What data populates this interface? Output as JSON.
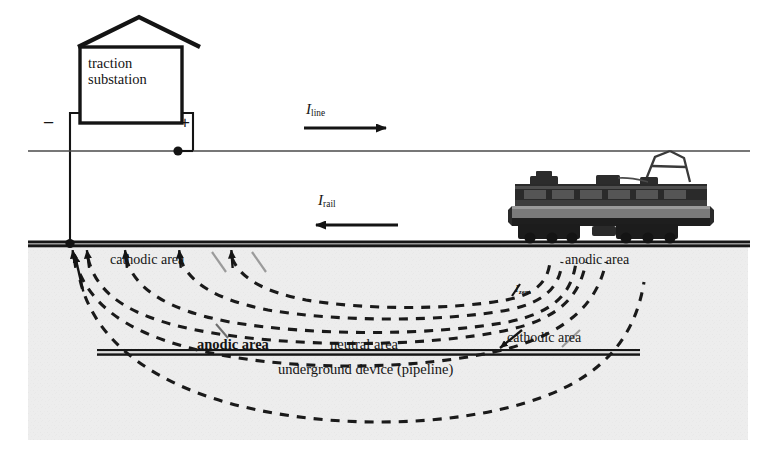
{
  "diagram": {
    "soil": {
      "fill": "#ededed",
      "left": 28,
      "top": 246,
      "width": 720,
      "height": 194
    },
    "substation": {
      "label_line1": "traction",
      "label_line2": "substation",
      "terminal_negative": "−",
      "terminal_positive": "+"
    },
    "currents": [
      {
        "name": "line-current",
        "symbol": "I",
        "subscript": "line",
        "direction": "right"
      },
      {
        "name": "rail-current",
        "symbol": "I",
        "subscript": "rail",
        "direction": "left"
      },
      {
        "name": "earth-current",
        "symbol": "I",
        "subscript": "zem",
        "direction": "none"
      }
    ],
    "rail_labels": {
      "cathodic": "cathodic area",
      "anodic": "anodic area"
    },
    "pipeline_labels": {
      "anodic": "anodic area",
      "neutral": "neutral area",
      "cathodic": "cathodic area",
      "caption": "underground device (pipeline)"
    },
    "vehicle": {
      "name": "electric-locomotive",
      "pantograph": "raised"
    },
    "colors": {
      "line": "#141414",
      "dashed_current": "#1a1a1a",
      "soil": "#ededed",
      "background": "#ffffff"
    }
  }
}
